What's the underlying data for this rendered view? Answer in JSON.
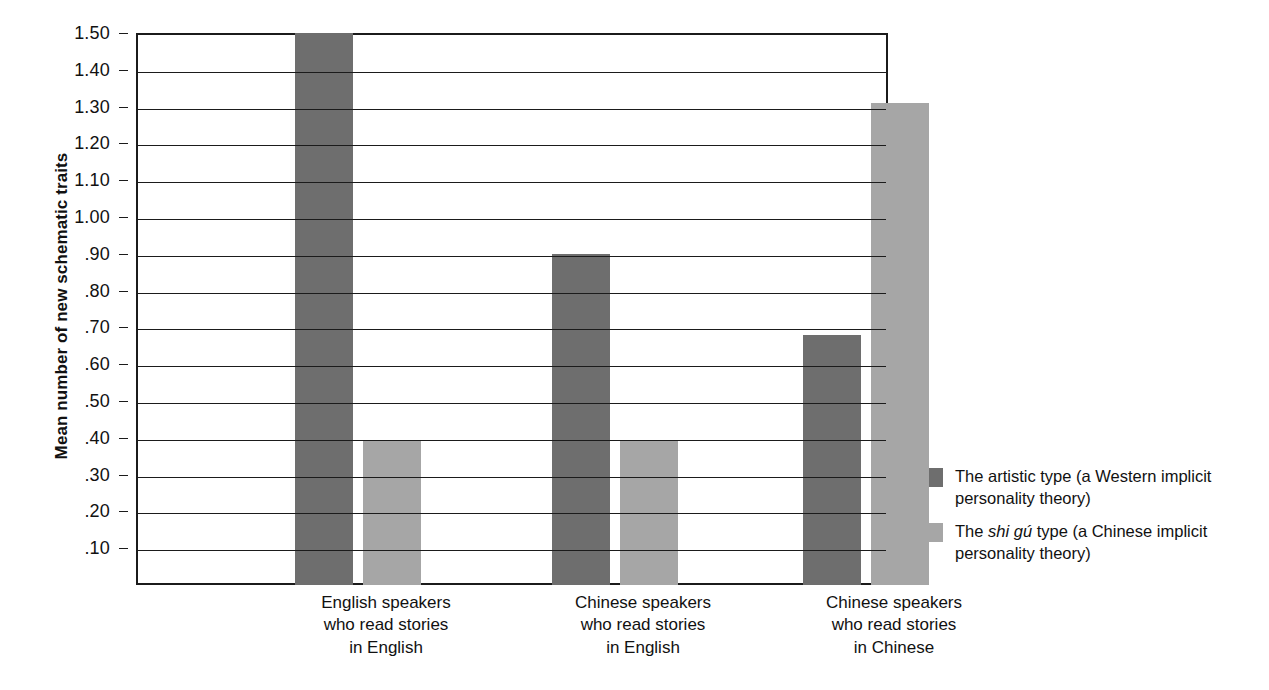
{
  "chart_data": {
    "type": "bar",
    "title": "",
    "xlabel": "",
    "ylabel": "Mean number of new schematic traits",
    "ylim": [
      0,
      1.5
    ],
    "grid": true,
    "legend_position": "right",
    "categories": [
      "English speakers\nwho read stories\nin English",
      "Chinese speakers\nwho read stories\nin English",
      "Chinese speakers\nwho read stories\nin Chinese"
    ],
    "ytick_labels": [
      "1.50",
      "1.40",
      "1.30",
      "1.20",
      "1.10",
      "1.00",
      ".90",
      ".80",
      ".70",
      ".60",
      ".50",
      ".40",
      ".30",
      ".20",
      ".10"
    ],
    "ytick_values": [
      1.5,
      1.4,
      1.3,
      1.2,
      1.1,
      1.0,
      0.9,
      0.8,
      0.7,
      0.6,
      0.5,
      0.4,
      0.3,
      0.2,
      0.1
    ],
    "series": [
      {
        "name": "The artistic type (a Western implicit personality theory)",
        "color": "#6e6e6e",
        "values": [
          1.5,
          0.9,
          0.68
        ]
      },
      {
        "name": "The shi gú type (a Chinese implicit personality theory)",
        "color": "#a6a6a6",
        "values": [
          0.39,
          0.39,
          1.31
        ]
      }
    ]
  },
  "axis": {
    "y_title": "Mean number of new schematic traits"
  },
  "xcats": [
    {
      "line1": "English speakers",
      "line2": "who read stories",
      "line3": "in English"
    },
    {
      "line1": "Chinese speakers",
      "line2": "who read stories",
      "line3": "in English"
    },
    {
      "line1": "Chinese speakers",
      "line2": "who read stories",
      "line3": "in Chinese"
    }
  ],
  "legend": {
    "items": [
      {
        "color": "#6e6e6e",
        "pre": "The artistic type (a Western implicit",
        "em": "",
        "post": "",
        "line2": "personality theory)"
      },
      {
        "color": "#a6a6a6",
        "pre": "The ",
        "em": "shi gú",
        "post": " type (a Chinese implicit",
        "line2": "personality theory)"
      }
    ]
  }
}
